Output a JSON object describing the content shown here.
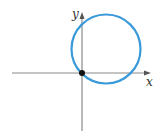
{
  "diagram": {
    "type": "circle-on-axes",
    "axes": {
      "x_label": "x",
      "y_label": "y",
      "color": "#8a8a8a"
    },
    "circle": {
      "color": "#3a9ad9",
      "passes_through_origin": true
    },
    "origin_point": {
      "color": "#111111"
    }
  }
}
